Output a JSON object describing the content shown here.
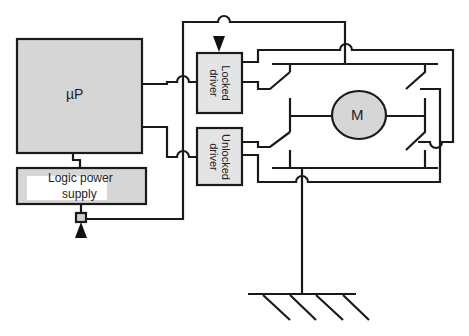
{
  "diagram": {
    "type": "circuit-block-diagram",
    "blocks": {
      "microprocessor": {
        "label": "µP"
      },
      "logic_power_supply": {
        "label_line1": "Logic power",
        "label_line2": "supply"
      },
      "locked_driver": {
        "label_line1": "Locked",
        "label_line2": "driver"
      },
      "unlocked_driver": {
        "label_line1": "Unlocked",
        "label_line2": "driver"
      },
      "motor": {
        "label": "M"
      }
    },
    "colors": {
      "block_fill": "#d6d6d6",
      "driver_fill": "#e4e4e4",
      "stroke": "#1a1a1a",
      "background": "#ffffff"
    }
  }
}
